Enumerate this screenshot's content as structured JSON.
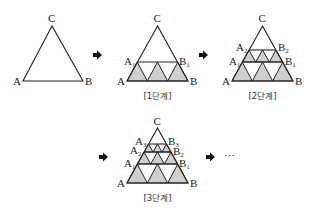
{
  "colors": {
    "line": "#222222",
    "shade": "#cfcfcf",
    "background": "#ffffff"
  },
  "stage0": {
    "labels": {
      "C": "C",
      "A": "A",
      "B": "B"
    }
  },
  "stage1": {
    "labels": {
      "C": "C",
      "A": "A",
      "B": "B",
      "A1": "A",
      "A1_sub": "1",
      "B1": "B",
      "B1_sub": "1"
    },
    "caption": "[1단계]"
  },
  "stage2": {
    "labels": {
      "C": "C",
      "A": "A",
      "B": "B",
      "A1": "A",
      "A1_sub": "1",
      "B1": "B",
      "B1_sub": "1",
      "A2": "A",
      "A2_sub": "2",
      "B2": "B",
      "B2_sub": "2"
    },
    "caption": "[2단계]"
  },
  "stage3": {
    "labels": {
      "C": "C",
      "A": "A",
      "B": "B",
      "A1": "A",
      "A1_sub": "1",
      "B1": "B",
      "B1_sub": "1",
      "A2": "A",
      "A2_sub": "2",
      "B2": "B",
      "B2_sub": "2",
      "A3": "A",
      "A3_sub": "3",
      "B3": "B",
      "B3_sub": "3"
    },
    "caption": "[3단계]"
  },
  "arrows": [
    "right-arrow",
    "right-arrow",
    "right-arrow",
    "right-arrow"
  ],
  "ellipsis": "⋯"
}
